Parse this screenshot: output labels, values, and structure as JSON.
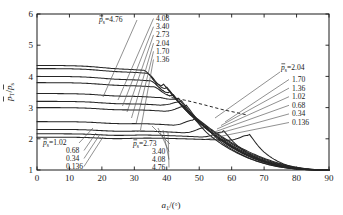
{
  "chart_data": {
    "type": "line",
    "title": "",
    "xlabel": "a₁/(°)",
    "ylabel": "p̄_T/p̄_s",
    "xlim": [
      0,
      90
    ],
    "ylim": [
      1,
      6
    ],
    "xticks": [
      "0",
      "10",
      "20",
      "30",
      "40",
      "50",
      "60",
      "70",
      "80",
      "90"
    ],
    "yticks": [
      "1",
      "2",
      "3",
      "4",
      "5",
      "6"
    ],
    "grid": false,
    "legend_position": "inline-annotations",
    "parameter_symbol": "p̄_s",
    "series": [
      {
        "name": "0.136",
        "p_s": 0.136,
        "y0": 2.05,
        "peak_x": 65.0,
        "peak_y": 2.62
      },
      {
        "name": "0.34",
        "p_s": 0.34,
        "y0": 2.16,
        "peak_x": 57.0,
        "peak_y": 2.8
      },
      {
        "name": "0.68",
        "p_s": 0.68,
        "y0": 2.3,
        "peak_x": 51.5,
        "peak_y": 2.95
      },
      {
        "name": "1.02",
        "p_s": 1.02,
        "y0": 2.55,
        "peak_x": 48.0,
        "peak_y": 3.04
      },
      {
        "name": "1.36",
        "p_s": 1.36,
        "y0": 3.0,
        "peak_x": 45.5,
        "peak_y": 3.1
      },
      {
        "name": "1.70",
        "p_s": 1.7,
        "y0": 3.2,
        "peak_x": 44.0,
        "peak_y": 3.13
      },
      {
        "name": "2.04",
        "p_s": 2.04,
        "y0": 3.45,
        "peak_x": 43.0,
        "peak_y": 3.15
      },
      {
        "name": "2.73",
        "p_s": 2.73,
        "y0": 3.8,
        "peak_x": 41.5,
        "peak_y": 3.18
      },
      {
        "name": "3.40",
        "p_s": 3.4,
        "y0": 4.0,
        "peak_x": 40.5,
        "peak_y": 3.25
      },
      {
        "name": "4.08",
        "p_s": 4.08,
        "y0": 4.25,
        "peak_x": 39.5,
        "peak_y": 3.35
      },
      {
        "name": "4.76",
        "p_s": 4.76,
        "y0": 4.35,
        "peak_x": 38.5,
        "peak_y": 3.45
      }
    ],
    "envelope": {
      "name": "envelope",
      "style": "dashed"
    },
    "annotation_groups": [
      {
        "id": "top-center",
        "lead_label": "p̄ₛ=4.76",
        "items": [
          "4.08",
          "3.40",
          "2.73",
          "2.04",
          "1.70",
          "1.36"
        ]
      },
      {
        "id": "bottom-left",
        "lead_label": "p̄ₛ=1.02",
        "items": [
          "0.68",
          "0.34",
          "0.136"
        ]
      },
      {
        "id": "bottom-center",
        "lead_label": "p̄ₛ=2.73",
        "items": [
          "3.40",
          "4.08",
          "4.76"
        ]
      },
      {
        "id": "right",
        "lead_label": "p̄ₛ=2.04",
        "items": [
          "1.70",
          "1.36",
          "1.02",
          "0.68",
          "0.34",
          "0.136"
        ]
      }
    ]
  },
  "axes": {
    "x_title": "a₁/(°)",
    "y_title_num": "p̄",
    "y_title_sub1": "T",
    "y_title_den": "p̄",
    "y_title_sub2": "s"
  },
  "colors": {
    "line": "#262626",
    "axis": "#1a1a1a",
    "leader": "#555555",
    "background": "#ffffff"
  }
}
